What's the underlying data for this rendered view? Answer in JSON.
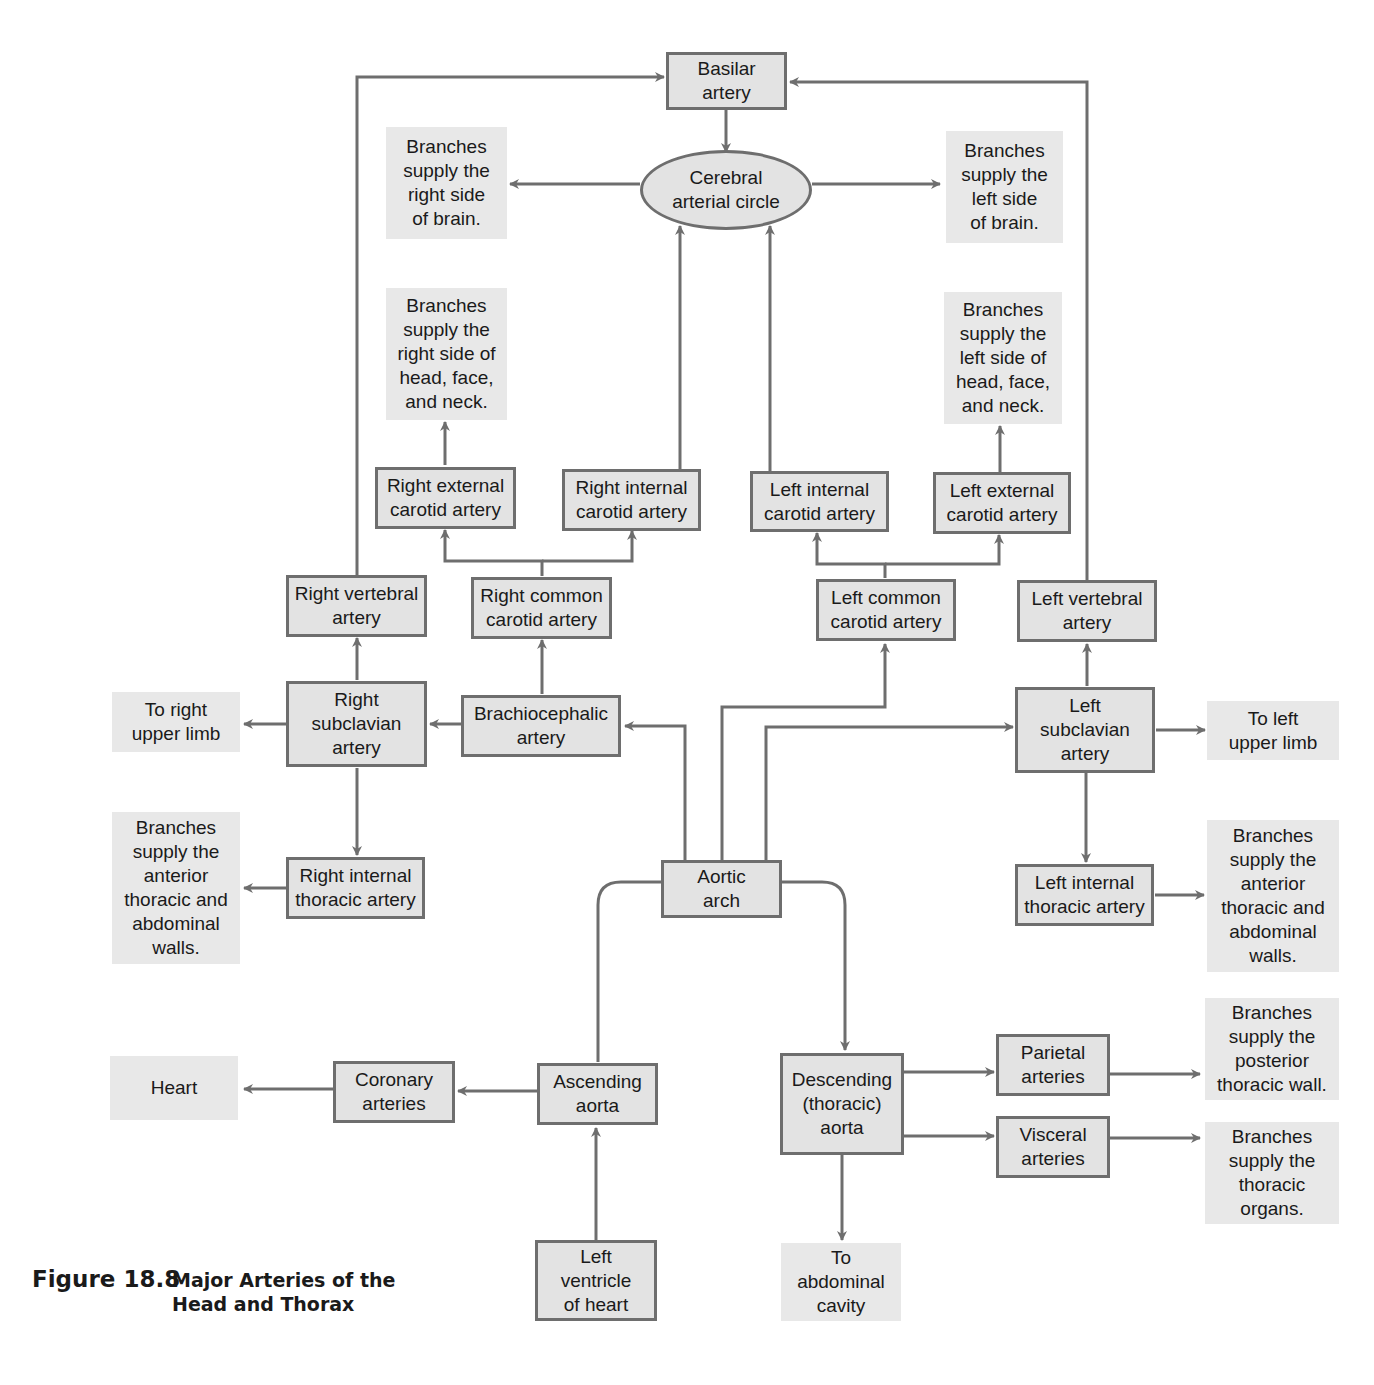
{
  "figure": {
    "number": "Figure 18.8",
    "title": "Major Arteries of the\nHead and Thorax"
  },
  "colors": {
    "box_fill": "#e3e3e3",
    "box_border": "#6e6e6e",
    "note_fill": "#e8e8e8",
    "line": "#6e6e6e",
    "text": "#1a1a1a"
  },
  "nodes": {
    "basilar": "Basilar\nartery",
    "cerebral_circle": "Cerebral\narterial circle",
    "brain_right": "Branches\nsupply the\nright side\nof brain.",
    "brain_left": "Branches\nsupply the\nleft side\nof brain.",
    "hfn_right": "Branches\nsupply the\nright side of\nhead, face,\nand neck.",
    "hfn_left": "Branches\nsupply the\nleft side of\nhead, face,\nand neck.",
    "r_ext_carotid": "Right external\ncarotid artery",
    "r_int_carotid": "Right internal\ncarotid artery",
    "l_int_carotid": "Left internal\ncarotid artery",
    "l_ext_carotid": "Left external\ncarotid artery",
    "r_vertebral": "Right vertebral\nartery",
    "r_common_carotid": "Right common\ncarotid artery",
    "l_common_carotid": "Left common\ncarotid artery",
    "l_vertebral": "Left vertebral\nartery",
    "to_r_limb": "To right\nupper limb",
    "r_subclavian": "Right\nsubclavian\nartery",
    "brachiocephalic": "Brachiocephalic\nartery",
    "l_subclavian": "Left\nsubclavian\nartery",
    "to_l_limb": "To left\nupper limb",
    "r_ant_walls": "Branches\nsupply the\nanterior\nthoracic and\nabdominal\nwalls.",
    "r_int_thoracic": "Right internal\nthoracic artery",
    "aortic_arch": "Aortic\narch",
    "l_int_thoracic": "Left internal\nthoracic artery",
    "l_ant_walls": "Branches\nsupply the\nanterior\nthoracic and\nabdominal\nwalls.",
    "post_wall": "Branches\nsupply the\nposterior\nthoracic wall.",
    "parietal": "Parietal\narteries",
    "heart": "Heart",
    "coronary": "Coronary\narteries",
    "ascending": "Ascending\naorta",
    "descending": "Descending\n(thoracic)\naorta",
    "visceral": "Visceral\narteries",
    "thoracic_organs": "Branches\nsupply the\nthoracic\norgans.",
    "left_ventricle": "Left\nventricle\nof heart",
    "abdominal": "To\nabdominal\ncavity"
  }
}
